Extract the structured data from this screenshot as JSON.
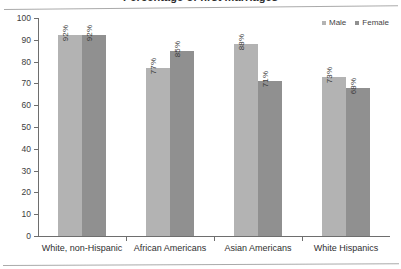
{
  "chart_data": {
    "type": "bar",
    "title": "Percentage of first marriages",
    "categories": [
      "White, non-Hispanic",
      "African Americans",
      "Asian Americans",
      "White Hispanics"
    ],
    "series": [
      {
        "name": "Male",
        "color": "#b3b3b3",
        "values": [
          92,
          77,
          88,
          73
        ],
        "labels": [
          "92%",
          "77%",
          "88%",
          "73%"
        ]
      },
      {
        "name": "Female",
        "color": "#909090",
        "values": [
          92,
          85,
          71,
          68
        ],
        "labels": [
          "92%",
          "85%",
          "71%",
          "68%"
        ]
      }
    ],
    "xlabel": "",
    "ylabel": "",
    "ylim": [
      0,
      100
    ],
    "ystep": 10,
    "yticks": [
      "100",
      "90",
      "80",
      "70",
      "60",
      "50",
      "40",
      "30",
      "20",
      "10",
      "0"
    ],
    "grid": false,
    "legend_position": "top-right",
    "value_label_rotation": "vertical"
  },
  "legend": {
    "items": [
      {
        "label": "Male",
        "color": "#b3b3b3"
      },
      {
        "label": "Female",
        "color": "#909090"
      }
    ]
  }
}
